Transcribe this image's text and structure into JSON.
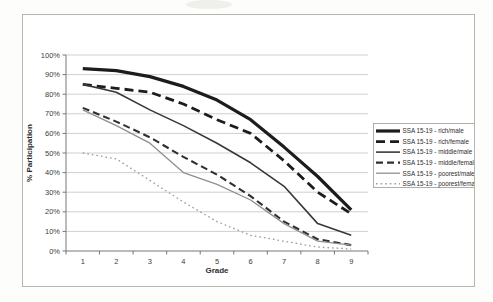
{
  "chart_data": {
    "type": "line",
    "title": "",
    "xlabel": "Grade",
    "ylabel": "% Participation",
    "categories": [
      1,
      2,
      3,
      4,
      5,
      6,
      7,
      8,
      9
    ],
    "ylim": [
      0,
      100
    ],
    "y_tick_step": 10,
    "y_tick_labels": [
      "0%",
      "10%",
      "20%",
      "30%",
      "40%",
      "50%",
      "60%",
      "70%",
      "80%",
      "90%",
      "100%"
    ],
    "grid": "horizontal",
    "legend_position": "right",
    "colors": {
      "gridline": "#cfcfcf",
      "axis": "#777777",
      "frame_border": "#b6b6b0",
      "legend_border": "#9a9a9a",
      "text": "#3c3c3c"
    },
    "series": [
      {
        "name": "SSA 15-19 - rich/male",
        "values": [
          93,
          92,
          89,
          84,
          77,
          67,
          53,
          38,
          21
        ],
        "stroke": "#1c1c1c",
        "width": 3.2,
        "dash": "solid"
      },
      {
        "name": "SSA 15-19 - rich/female",
        "values": [
          85,
          83,
          81,
          75,
          67,
          60,
          46,
          30,
          19
        ],
        "stroke": "#1c1c1c",
        "width": 2.8,
        "dash": "long-dash"
      },
      {
        "name": "SSA 15-19 - middle/male",
        "values": [
          85,
          81,
          72,
          64,
          55,
          45,
          33,
          14,
          8
        ],
        "stroke": "#383838",
        "width": 1.6,
        "dash": "solid"
      },
      {
        "name": "SSA 15-19 - middle/female",
        "values": [
          73,
          66,
          58,
          48,
          39,
          28,
          15,
          6,
          3
        ],
        "stroke": "#2f2f2f",
        "width": 2.1,
        "dash": "dash"
      },
      {
        "name": "SSA 15-19 - poorest/male",
        "values": [
          72,
          64,
          55,
          40,
          34,
          26,
          14,
          5,
          3
        ],
        "stroke": "#8f8f8f",
        "width": 1.3,
        "dash": "solid"
      },
      {
        "name": "SSA 15-19 - poorest/female",
        "values": [
          50,
          47,
          36,
          25,
          15,
          8,
          5,
          2,
          1
        ],
        "stroke": "#9b9b9b",
        "width": 1.3,
        "dash": "dot"
      }
    ]
  }
}
